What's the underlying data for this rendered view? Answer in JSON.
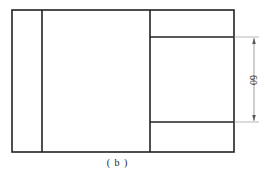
{
  "drawing": {
    "outer_rect": {
      "x": 12,
      "y": 10,
      "w": 222,
      "h": 142
    },
    "left_strip_line_x": 42,
    "middle_divider_x": 150,
    "right_panel_lines_y": [
      37,
      122
    ],
    "dimension": {
      "x": 254,
      "y1": 37,
      "y2": 122,
      "label": "60"
    },
    "stroke_color": "#222222",
    "dimension_color": "#888888"
  },
  "caption": "( b )"
}
